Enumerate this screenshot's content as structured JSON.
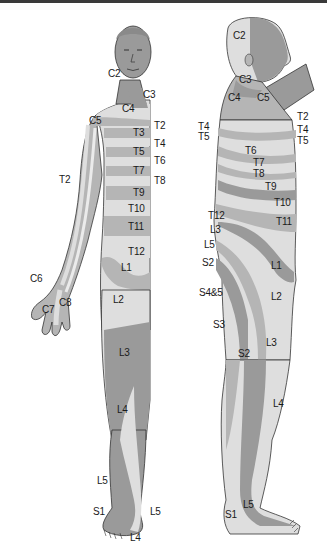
{
  "colors": {
    "dark": "#9a9a9a",
    "mid": "#b5b5b5",
    "light": "#dedede",
    "lighter": "#ebebeb",
    "outline": "#333333",
    "text": "#1a1a1a",
    "border": "#3a3a3a"
  },
  "front_view": {
    "labels": [
      {
        "text": "C2",
        "x": 108,
        "y": 74
      },
      {
        "text": "C3",
        "x": 143,
        "y": 95
      },
      {
        "text": "C4",
        "x": 122,
        "y": 109
      },
      {
        "text": "C5",
        "x": 89,
        "y": 121
      },
      {
        "text": "T2",
        "x": 154,
        "y": 126
      },
      {
        "text": "T3",
        "x": 133,
        "y": 133
      },
      {
        "text": "T4",
        "x": 154,
        "y": 144
      },
      {
        "text": "T5",
        "x": 133,
        "y": 152
      },
      {
        "text": "T6",
        "x": 154,
        "y": 161
      },
      {
        "text": "T7",
        "x": 133,
        "y": 171
      },
      {
        "text": "T8",
        "x": 154,
        "y": 181
      },
      {
        "text": "T2",
        "x": 59,
        "y": 180
      },
      {
        "text": "T9",
        "x": 133,
        "y": 193
      },
      {
        "text": "T10",
        "x": 128,
        "y": 209
      },
      {
        "text": "T11",
        "x": 128,
        "y": 227
      },
      {
        "text": "T12",
        "x": 128,
        "y": 252
      },
      {
        "text": "L1",
        "x": 121,
        "y": 268
      },
      {
        "text": "C6",
        "x": 30,
        "y": 279
      },
      {
        "text": "C8",
        "x": 59,
        "y": 303
      },
      {
        "text": "C7",
        "x": 42,
        "y": 310
      },
      {
        "text": "L2",
        "x": 113,
        "y": 300
      },
      {
        "text": "L3",
        "x": 119,
        "y": 353
      },
      {
        "text": "L4",
        "x": 117,
        "y": 410
      },
      {
        "text": "L5",
        "x": 97,
        "y": 481
      },
      {
        "text": "S1",
        "x": 93,
        "y": 512
      },
      {
        "text": "L5",
        "x": 150,
        "y": 512
      },
      {
        "text": "L4",
        "x": 130,
        "y": 538
      }
    ]
  },
  "side_view": {
    "labels": [
      {
        "text": "C2",
        "x": 233,
        "y": 36
      },
      {
        "text": "C3",
        "x": 239,
        "y": 80
      },
      {
        "text": "C4",
        "x": 228,
        "y": 98
      },
      {
        "text": "C5",
        "x": 257,
        "y": 98
      },
      {
        "text": "T2",
        "x": 297,
        "y": 117
      },
      {
        "text": "T4",
        "x": 198,
        "y": 127
      },
      {
        "text": "T4",
        "x": 297,
        "y": 130
      },
      {
        "text": "T5",
        "x": 198,
        "y": 137
      },
      {
        "text": "T5",
        "x": 297,
        "y": 141
      },
      {
        "text": "T6",
        "x": 245,
        "y": 151
      },
      {
        "text": "T7",
        "x": 253,
        "y": 163
      },
      {
        "text": "T8",
        "x": 253,
        "y": 174
      },
      {
        "text": "T9",
        "x": 265,
        "y": 187
      },
      {
        "text": "T10",
        "x": 274,
        "y": 203
      },
      {
        "text": "T11",
        "x": 276,
        "y": 222
      },
      {
        "text": "T12",
        "x": 208,
        "y": 216
      },
      {
        "text": "L3",
        "x": 210,
        "y": 230
      },
      {
        "text": "L5",
        "x": 204,
        "y": 245
      },
      {
        "text": "S2",
        "x": 202,
        "y": 263
      },
      {
        "text": "L1",
        "x": 271,
        "y": 266
      },
      {
        "text": "S4&5",
        "x": 199,
        "y": 293
      },
      {
        "text": "L2",
        "x": 271,
        "y": 297
      },
      {
        "text": "S3",
        "x": 213,
        "y": 325
      },
      {
        "text": "L3",
        "x": 266,
        "y": 343
      },
      {
        "text": "S2",
        "x": 238,
        "y": 354
      },
      {
        "text": "L4",
        "x": 273,
        "y": 404
      },
      {
        "text": "L5",
        "x": 243,
        "y": 505
      },
      {
        "text": "S1",
        "x": 225,
        "y": 515
      }
    ]
  }
}
